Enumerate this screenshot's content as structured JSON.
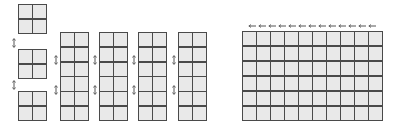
{
  "diagram": {
    "colors": {
      "cell_fill": "#e9e9e9",
      "cell_border": "#4a4a4a",
      "arrow": "#555555",
      "background": "#ffffff"
    },
    "small_blocks": [
      {
        "rows": 2,
        "cols": 2,
        "x": 18,
        "y": 4,
        "w": 29,
        "h": 30
      },
      {
        "rows": 2,
        "cols": 2,
        "x": 18,
        "y": 49,
        "w": 29,
        "h": 30
      },
      {
        "rows": 2,
        "cols": 2,
        "x": 18,
        "y": 91,
        "w": 29,
        "h": 30
      }
    ],
    "small_arrows": [
      {
        "x": 12,
        "y": 38
      },
      {
        "x": 12,
        "y": 80
      }
    ],
    "tall_columns": [
      {
        "rows": 6,
        "cols": 2,
        "x": 60,
        "y": 32,
        "w": 29,
        "h": 89
      },
      {
        "rows": 6,
        "cols": 2,
        "x": 99,
        "y": 32,
        "w": 29,
        "h": 89
      },
      {
        "rows": 6,
        "cols": 2,
        "x": 138,
        "y": 32,
        "w": 29,
        "h": 89
      },
      {
        "rows": 6,
        "cols": 2,
        "x": 178,
        "y": 32,
        "w": 29,
        "h": 89
      }
    ],
    "column_arrows": [
      {
        "x": 54,
        "y": 55
      },
      {
        "x": 54,
        "y": 85
      },
      {
        "x": 93,
        "y": 55
      },
      {
        "x": 93,
        "y": 85
      },
      {
        "x": 132,
        "y": 55
      },
      {
        "x": 132,
        "y": 85
      },
      {
        "x": 172,
        "y": 55
      },
      {
        "x": 172,
        "y": 85
      }
    ],
    "large_grid": {
      "rows": 6,
      "cols": 10,
      "x": 242,
      "y": 31,
      "w": 141,
      "h": 90
    },
    "top_arrow_row": {
      "x": 248,
      "y": 24,
      "w": 130,
      "count": 13
    }
  }
}
